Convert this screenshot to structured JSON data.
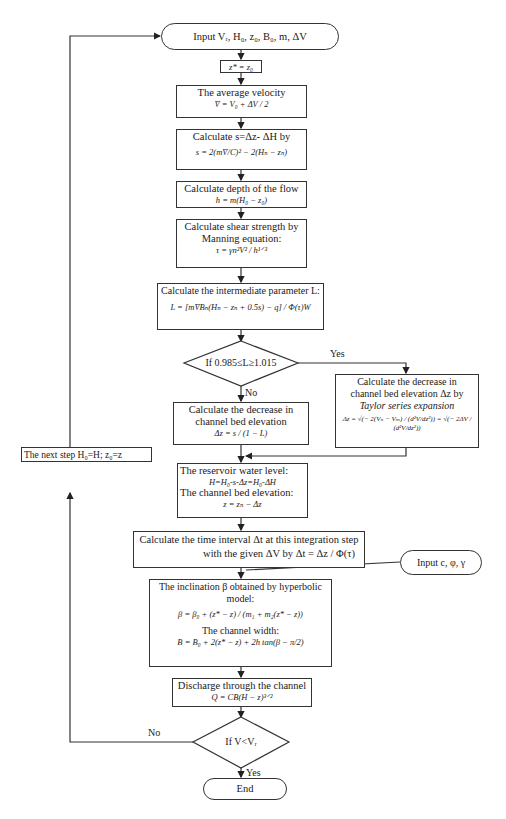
{
  "flowchart": {
    "start": "Input Vᵣ, H₀, z₀, B₀, m, ΔV",
    "init": "z* = z₀",
    "avg_velocity": {
      "title": "The average velocity",
      "eq": "V̄ = V₀ + ΔV / 2"
    },
    "calc_s": {
      "title": "Calculate s=Δz- ΔH by",
      "eq": "s = 2(mV̄/C)² − 2(Hₙ − zₙ)"
    },
    "depth": {
      "title": "Calculate depth of the flow",
      "eq": "h = m(H₀ − z₀)"
    },
    "shear": {
      "title": "Calculate shear strength by",
      "title2": "Manning equation:",
      "eq": "τ = γn²V² / h¹ᐟ³"
    },
    "param_L": {
      "title": "Calculate the intermediate parameter L:",
      "eq": "L = [mV̄Bₙ(Hₙ − zₙ + 0.5s) − q] / Φ(τ)W"
    },
    "decision1": {
      "text": "If 0.985≤L≥1.015",
      "yes": "Yes",
      "no": "No"
    },
    "decrease_simple": {
      "title": "Calculate the decrease in",
      "title2": "channel bed elevation",
      "eq": "Δz = s / (1 − L)"
    },
    "decrease_taylor": {
      "title": "Calculate the decrease in",
      "title2": "channel bed elevation Δz by",
      "title3": "Taylor series expansion",
      "eq": "Δz = √(− 2(Vₙ − Vₘ) / (d²V/dz²)) = √(− 2ΔV / (d²V/dz²))"
    },
    "next_step": "The next step H₀=H; z₀=z",
    "reservoir": {
      "title": "The reservoir water level:",
      "eq": "H=H₀-s-Δz=H₀-ΔH",
      "title2": "The channel bed elevation:",
      "eq2": "z = zₙ − Δz"
    },
    "time_interval": {
      "line1": "Calculate the time interval Δt at this integration step",
      "line2": "with the given ΔV by  Δt = Δz / Φ(τ)"
    },
    "input2": "Input c, φ, γ",
    "inclination": {
      "title": "The inclination β obtained by hyperbolic model:",
      "eq": "β = β₀ + (z* − z) / (m₁ + m₂(z* − z))",
      "title2": "The channel width:",
      "eq2": "B = B₀ + 2(z* − z) + 2h tan(β − π/2)"
    },
    "discharge": {
      "title": "Discharge through the channel",
      "eq": "Q = CB(H − z)³ᐟ²"
    },
    "decision2": {
      "text": "If V<Vᵣ",
      "yes": "Yes",
      "no": "No"
    },
    "end": "End"
  }
}
